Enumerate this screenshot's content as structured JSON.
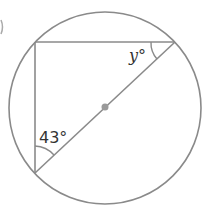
{
  "diagram": {
    "type": "inscribed-triangle-in-circle",
    "angles": {
      "bottom_left": "43°",
      "top_right_var": "y",
      "top_right_suffix": "°"
    },
    "colors": {
      "stroke": "#8a8a8a",
      "center": "#9a9a9a",
      "text": "#333333"
    }
  }
}
